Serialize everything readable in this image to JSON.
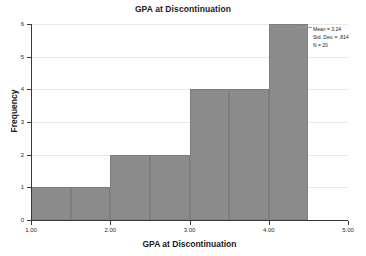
{
  "chart_data": {
    "type": "bar",
    "title": "GPA at Discontinuation",
    "xlabel": "GPA at Discontinuation",
    "ylabel": "Frequency",
    "xlim": [
      1.0,
      5.0
    ],
    "ylim": [
      0,
      6
    ],
    "grid": true,
    "legend": "none",
    "bin_width": 0.5,
    "bin_starts": [
      1.0,
      1.5,
      2.0,
      2.5,
      3.0,
      3.5,
      4.0
    ],
    "bin_ends": [
      1.5,
      2.0,
      2.5,
      3.0,
      3.5,
      4.0,
      4.5
    ],
    "categories": [
      "1.00-1.50",
      "1.50-2.00",
      "2.00-2.50",
      "2.50-3.00",
      "3.00-3.50",
      "3.50-4.00",
      "4.00-4.50"
    ],
    "values": [
      1,
      1,
      2,
      2,
      4,
      4,
      6
    ],
    "x_ticks": [
      1.0,
      2.0,
      3.0,
      4.0,
      5.0
    ],
    "x_tick_labels": [
      "1.00",
      "2.00",
      "3.00",
      "4.00",
      "5.00"
    ],
    "y_ticks": [
      0,
      1,
      2,
      3,
      4,
      5,
      6
    ],
    "y_tick_labels": [
      "0",
      "1",
      "2",
      "3",
      "4",
      "5",
      "6"
    ],
    "bar_color": "#8c8c8c",
    "gridline_color": "#e9e9e9",
    "axis_color": "#3a3a3a",
    "annotations": {
      "mean": "Mean = 3.24",
      "std_dev": "Std. Dev. = .814",
      "n": "N = 20"
    }
  }
}
